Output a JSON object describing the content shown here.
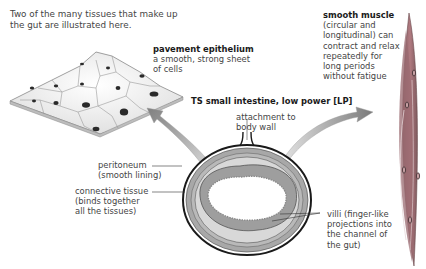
{
  "intro": {
    "line1": "Two of the many tissues that make up",
    "line2": "the gut are illustrated here."
  },
  "pavement": {
    "title": "pavement epithelium",
    "desc1": "a smooth, strong sheet",
    "desc2": "of cells"
  },
  "section": {
    "title": "TS small intestine, low power [LP]"
  },
  "labels": {
    "attachment1": "attachment to",
    "attachment2": "body wall",
    "peritoneum1": "peritoneum",
    "peritoneum2": "(smooth lining)",
    "connective1": "connective tissue",
    "connective2": "(binds together",
    "connective3": "all the tissues)",
    "villi1": "villi (finger-like",
    "villi2": "projections into",
    "villi3": "the channel of",
    "villi4": "the gut)"
  },
  "muscle": {
    "title": "smooth muscle",
    "desc1": "(circular and",
    "desc2": "longitudinal) can",
    "desc3": "contract and relax",
    "desc4": "repeatedly for",
    "desc5": "long periods",
    "desc6": "without fatigue"
  },
  "colors": {
    "tissue_red": "#b85a62",
    "tissue_gray": "#9a9a9a",
    "arrow_gray": "#8c8c8c",
    "nucleus": "#2a2a2a"
  }
}
